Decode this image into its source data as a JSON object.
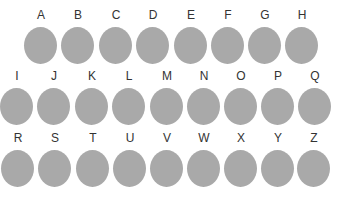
{
  "circle_color": "#a9a9a9",
  "rows": [
    {
      "items": [
        {
          "letter": "A",
          "x": 24,
          "y": 8
        },
        {
          "letter": "B",
          "x": 61,
          "y": 8
        },
        {
          "letter": "C",
          "x": 99,
          "y": 8
        },
        {
          "letter": "D",
          "x": 136,
          "y": 8
        },
        {
          "letter": "E",
          "x": 174,
          "y": 8
        },
        {
          "letter": "F",
          "x": 211,
          "y": 8
        },
        {
          "letter": "G",
          "x": 248,
          "y": 8
        },
        {
          "letter": "H",
          "x": 285,
          "y": 8
        }
      ]
    },
    {
      "items": [
        {
          "letter": "I",
          "x": 0,
          "y": 69
        },
        {
          "letter": "J",
          "x": 37,
          "y": 69
        },
        {
          "letter": "K",
          "x": 75,
          "y": 69
        },
        {
          "letter": "L",
          "x": 112,
          "y": 69
        },
        {
          "letter": "M",
          "x": 150,
          "y": 69
        },
        {
          "letter": "N",
          "x": 187,
          "y": 69
        },
        {
          "letter": "O",
          "x": 224,
          "y": 69
        },
        {
          "letter": "P",
          "x": 261,
          "y": 69
        },
        {
          "letter": "Q",
          "x": 298,
          "y": 69
        }
      ]
    },
    {
      "items": [
        {
          "letter": "R",
          "x": 1,
          "y": 131
        },
        {
          "letter": "S",
          "x": 38,
          "y": 131
        },
        {
          "letter": "T",
          "x": 76,
          "y": 131
        },
        {
          "letter": "U",
          "x": 113,
          "y": 131
        },
        {
          "letter": "V",
          "x": 150,
          "y": 131
        },
        {
          "letter": "W",
          "x": 187,
          "y": 131
        },
        {
          "letter": "X",
          "x": 224,
          "y": 131
        },
        {
          "letter": "Y",
          "x": 261,
          "y": 131
        },
        {
          "letter": "Z",
          "x": 297,
          "y": 131
        }
      ]
    }
  ]
}
